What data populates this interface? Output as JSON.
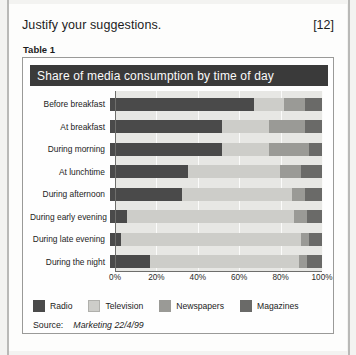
{
  "question": {
    "text": "Justify your suggestions.",
    "marks": "[12]"
  },
  "table_caption": "Table 1",
  "chart_title": "Share of media consumption by time of day",
  "source": {
    "label": "Source:",
    "value": "Marketing 22/4/99"
  },
  "colors": {
    "radio": "#4a4a4a",
    "television": "#cdcdc9",
    "newspapers": "#9a9a96",
    "magazines": "#6a6a68",
    "title_bar": "#3a3a3a",
    "plot_background": "#e7e7e4"
  },
  "chart_data": {
    "type": "bar",
    "orientation": "horizontal",
    "stacked": true,
    "percent_stacked": true,
    "title": "Share of media consumption by time of day",
    "xlabel": "",
    "ylabel": "",
    "xlim": [
      0,
      100
    ],
    "xticks": [
      "0%",
      "20%",
      "40%",
      "60%",
      "80%",
      "100%"
    ],
    "xtick_values": [
      0,
      20,
      40,
      60,
      80,
      100
    ],
    "grid": true,
    "legend_position": "bottom-left",
    "categories": [
      "Before breakfast",
      "At breakfast",
      "During morning",
      "At lunchtime",
      "During afternoon",
      "During early evening",
      "During late evening",
      "During the night"
    ],
    "series": [
      {
        "name": "Radio",
        "values": [
          68,
          53,
          53,
          37,
          34,
          8,
          5,
          19
        ]
      },
      {
        "name": "Television",
        "values": [
          14,
          22,
          22,
          43,
          52,
          79,
          85,
          70
        ]
      },
      {
        "name": "Newspapers",
        "values": [
          10,
          17,
          19,
          10,
          6,
          6,
          4,
          4
        ]
      },
      {
        "name": "Magazines",
        "values": [
          8,
          8,
          6,
          10,
          8,
          7,
          6,
          7
        ]
      }
    ]
  }
}
